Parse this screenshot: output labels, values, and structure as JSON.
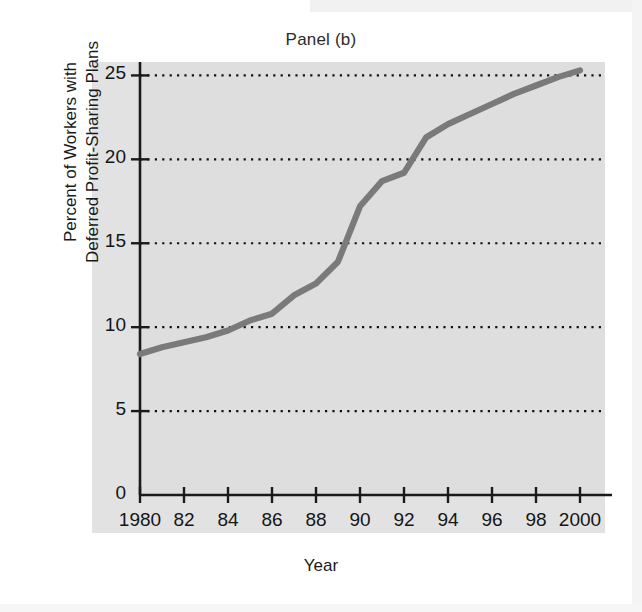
{
  "figure": {
    "title": "Panel (b)",
    "xlabel": "Year",
    "ylabel_line1": "Percent of Workers with",
    "ylabel_line2": "Deferred Profit-Sharing Plans",
    "plot_background": "#dedede",
    "line_color": "#7a7a7a",
    "axis_color": "#1a1a1a",
    "gridline_color": "#111111"
  },
  "axes": {
    "y_ticks": [
      "0",
      "5",
      "10",
      "15",
      "20",
      "25"
    ],
    "x_ticks": [
      "1980",
      "82",
      "84",
      "86",
      "88",
      "90",
      "92",
      "94",
      "96",
      "98",
      "2000"
    ]
  },
  "chart_data": {
    "type": "line",
    "title": "Panel (b)",
    "subtitle": "",
    "xlabel": "Year",
    "ylabel": "Percent of Workers with Deferred Profit-Sharing Plans",
    "xlim": [
      1980,
      2000
    ],
    "ylim": [
      0,
      25.8
    ],
    "x_tick_values": [
      1980,
      1982,
      1984,
      1986,
      1988,
      1990,
      1992,
      1994,
      1996,
      1998,
      2000
    ],
    "x_tick_labels": [
      "1980",
      "82",
      "84",
      "86",
      "88",
      "90",
      "92",
      "94",
      "96",
      "98",
      "2000"
    ],
    "y_tick_values": [
      0,
      5,
      10,
      15,
      20,
      25
    ],
    "y_tick_labels": [
      "0",
      "5",
      "10",
      "15",
      "20",
      "25"
    ],
    "grid": "horizontal-dotted",
    "gridline_values": [
      5,
      10,
      15,
      20,
      25
    ],
    "legend": "none",
    "x": [
      1980,
      1981,
      1982,
      1983,
      1984,
      1985,
      1986,
      1987,
      1988,
      1989,
      1990,
      1991,
      1992,
      1993,
      1994,
      1995,
      1996,
      1997,
      1998,
      1999,
      2000
    ],
    "values": [
      8.4,
      8.8,
      9.1,
      9.4,
      9.8,
      10.4,
      10.8,
      11.9,
      12.6,
      13.9,
      17.2,
      18.7,
      19.2,
      21.3,
      22.1,
      22.7,
      23.3,
      23.9,
      24.4,
      24.9,
      25.3
    ],
    "series": [
      {
        "name": "Percent of Workers with Deferred Profit-Sharing Plans",
        "values": [
          8.4,
          8.8,
          9.1,
          9.4,
          9.8,
          10.4,
          10.8,
          11.9,
          12.6,
          13.9,
          17.2,
          18.7,
          19.2,
          21.3,
          22.1,
          22.7,
          23.3,
          23.9,
          24.4,
          24.9,
          25.3
        ]
      }
    ]
  }
}
